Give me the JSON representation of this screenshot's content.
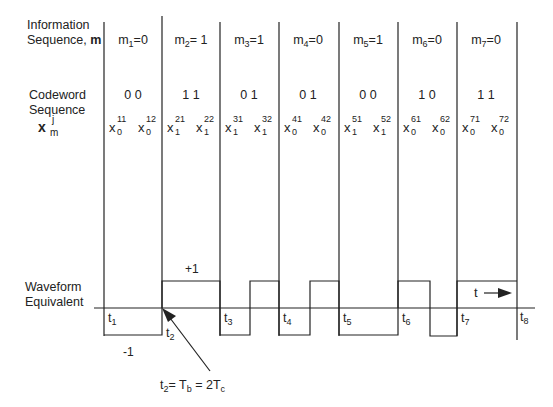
{
  "row_labels": {
    "info_line1": "Information",
    "info_line2": "Sequence, ",
    "info_bold": "m",
    "code_line1": "Codeword",
    "code_line2": "Sequence",
    "x_symbol": "x",
    "x_sup": "j",
    "x_sub": "m",
    "wave_line1": "Waveform",
    "wave_line2": "Equivalent"
  },
  "columns": [
    {
      "m_sub": "1",
      "m_val": "=0",
      "codeword": "0 0",
      "x1_sub": "0",
      "x1_sup": "11",
      "x2_sub": "0",
      "x2_sup": "12",
      "t_sub": "1"
    },
    {
      "m_sub": "2",
      "m_val": "= 1",
      "codeword": "1 1",
      "x1_sub": "1",
      "x1_sup": "21",
      "x2_sub": "1",
      "x2_sup": "22",
      "t_sub": "2"
    },
    {
      "m_sub": "3",
      "m_val": "=1",
      "codeword": "0 1",
      "x1_sub": "1",
      "x1_sup": "31",
      "x2_sub": "1",
      "x2_sup": "32",
      "t_sub": "3"
    },
    {
      "m_sub": "4",
      "m_val": "=0",
      "codeword": "0 1",
      "x1_sub": "0",
      "x1_sup": "41",
      "x2_sub": "0",
      "x2_sup": "42",
      "t_sub": "4"
    },
    {
      "m_sub": "5",
      "m_val": "=1",
      "codeword": "0 0",
      "x1_sub": "1",
      "x1_sup": "51",
      "x2_sub": "1",
      "x2_sup": "52",
      "t_sub": "5"
    },
    {
      "m_sub": "6",
      "m_val": "=0",
      "codeword": "1 0",
      "x1_sub": "0",
      "x1_sup": "61",
      "x2_sub": "0",
      "x2_sup": "62",
      "t_sub": "6"
    },
    {
      "m_sub": "7",
      "m_val": "=0",
      "codeword": "1 1",
      "x1_sub": "0",
      "x1_sup": "71",
      "x2_sub": "0",
      "x2_sup": "72",
      "t_sub": "7"
    }
  ],
  "t8_sub": "8",
  "waveform": {
    "plus_label": "+1",
    "minus_label": "-1",
    "time_arrow_label": "t",
    "levels": [
      -1,
      -1,
      1,
      1,
      -1,
      1,
      -1,
      1,
      -1,
      -1,
      1,
      -1,
      1,
      1
    ]
  },
  "annotation": {
    "t_label": "t",
    "t_sub": "2",
    "eq1": "= T",
    "eq1_sub": "b",
    "eq2": " = 2T",
    "eq2_sub": "c"
  },
  "colors": {
    "line": "#222222",
    "text": "#222222",
    "background": "#ffffff"
  }
}
